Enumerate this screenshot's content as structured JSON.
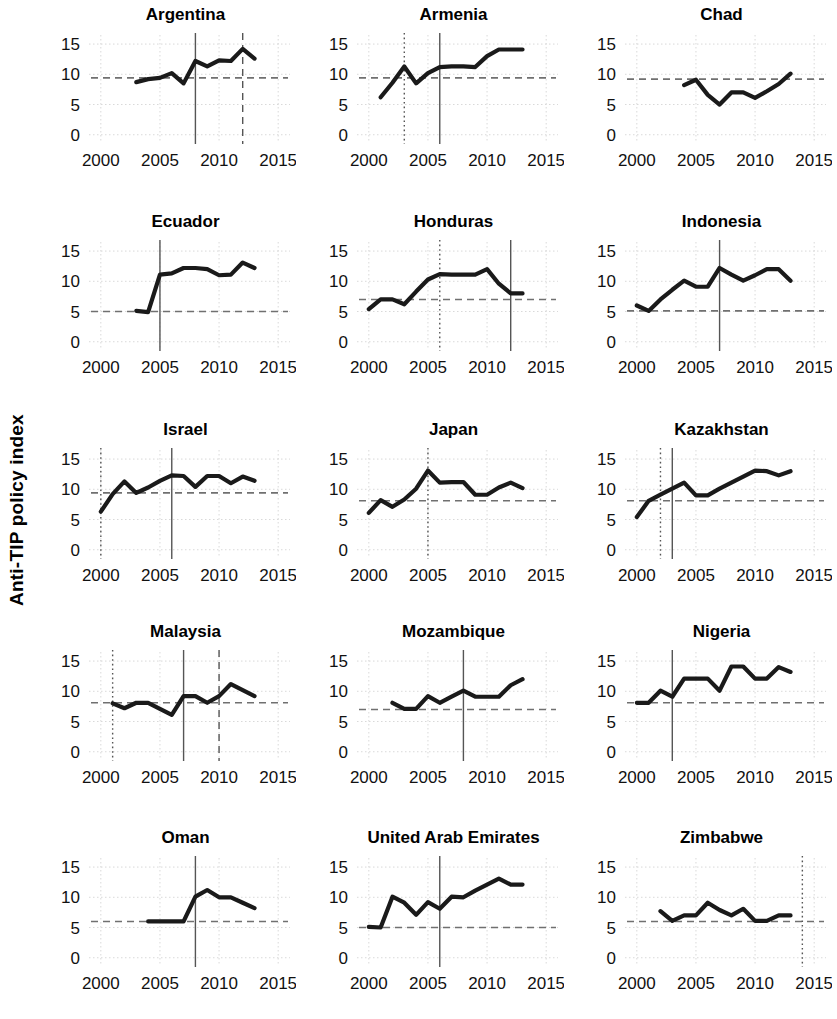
{
  "figure": {
    "ylabel": "Anti-TIP policy index",
    "panel_layout": {
      "rows": 5,
      "cols": 3
    },
    "line_color": "#1a1a1a",
    "grid_color": "#d9d9d9",
    "ref_line_color": "#707070",
    "event_line_color": "#555555"
  },
  "chart_data": {
    "type": "line",
    "title": "",
    "xlabel": "",
    "ylabel": "Anti-TIP policy index",
    "xlim": [
      1999,
      2016
    ],
    "ylim": [
      -1.2,
      16.5
    ],
    "xticks": [
      2000,
      2005,
      2010,
      2015
    ],
    "yticks": [
      0,
      5,
      10,
      15
    ],
    "grid": true,
    "legend": "none",
    "x_tick_labels": [
      "2000",
      "2005",
      "2010",
      "2015"
    ],
    "y_tick_labels": [
      "0",
      "5",
      "10",
      "15"
    ],
    "panels": [
      {
        "name": "Argentina",
        "x": [
          2003,
          2004,
          2005,
          2006,
          2007,
          2008,
          2009,
          2010,
          2011,
          2012,
          2013
        ],
        "values": [
          8.7,
          9.2,
          9.4,
          9.5,
          10.2,
          8.5,
          12.2,
          11.3,
          12.3,
          12.2,
          14.2,
          12.6
        ],
        "series": [
          {
            "name": "Anti-TIP policy index",
            "x": [
              2003,
              2004,
              2005,
              2006,
              2007,
              2008,
              2009,
              2010,
              2011,
              2012,
              2013
            ],
            "y": [
              8.7,
              9.2,
              9.4,
              10.2,
              8.5,
              12.2,
              11.3,
              12.3,
              12.2,
              14.2,
              12.6
            ]
          }
        ],
        "hline": 9.4,
        "vlines": [
          {
            "x": 2008,
            "style": "solid"
          },
          {
            "x": 2012,
            "style": "dashed"
          }
        ]
      },
      {
        "name": "Armenia",
        "series": [
          {
            "name": "Anti-TIP policy index",
            "x": [
              2001,
              2002,
              2003,
              2004,
              2005,
              2006,
              2007,
              2008,
              2009,
              2010,
              2011,
              2012,
              2013
            ],
            "y": [
              6.2,
              8.6,
              11.3,
              8.5,
              10.2,
              11.2,
              11.3,
              11.3,
              11.2,
              13.0,
              14.1,
              14.1,
              14.1
            ]
          }
        ],
        "hline": 9.4,
        "vlines": [
          {
            "x": 2003,
            "style": "dotted"
          },
          {
            "x": 2006,
            "style": "solid"
          }
        ]
      },
      {
        "name": "Chad",
        "series": [
          {
            "name": "Anti-TIP policy index",
            "x": [
              2004,
              2005,
              2006,
              2007,
              2008,
              2009,
              2010,
              2011,
              2012,
              2013
            ],
            "y": [
              8.2,
              9.1,
              6.6,
              5.0,
              7.0,
              7.0,
              6.1,
              7.2,
              8.4,
              10.1
            ]
          }
        ],
        "hline": 9.2,
        "vlines": []
      },
      {
        "name": "Ecuador",
        "series": [
          {
            "name": "Anti-TIP policy index",
            "x": [
              2003,
              2004,
              2005,
              2006,
              2007,
              2008,
              2009,
              2010,
              2011,
              2012,
              2013
            ],
            "y": [
              5.1,
              4.9,
              11.1,
              11.3,
              12.2,
              12.2,
              12.0,
              11.0,
              11.1,
              13.1,
              12.2
            ]
          }
        ],
        "hline": 5.0,
        "vlines": [
          {
            "x": 2005,
            "style": "solid"
          }
        ]
      },
      {
        "name": "Honduras",
        "series": [
          {
            "name": "Anti-TIP policy index",
            "x": [
              2000,
              2001,
              2002,
              2003,
              2004,
              2005,
              2006,
              2007,
              2008,
              2009,
              2010,
              2011,
              2012,
              2013
            ],
            "y": [
              5.4,
              7.0,
              7.0,
              6.2,
              8.3,
              10.3,
              11.2,
              11.1,
              11.1,
              11.1,
              12.0,
              9.6,
              8.0,
              8.0
            ]
          }
        ],
        "hline": 7.0,
        "vlines": [
          {
            "x": 2006,
            "style": "dotted"
          },
          {
            "x": 2012,
            "style": "solid"
          }
        ]
      },
      {
        "name": "Indonesia",
        "series": [
          {
            "name": "Anti-TIP policy index",
            "x": [
              2000,
              2001,
              2002,
              2003,
              2004,
              2005,
              2006,
              2007,
              2008,
              2009,
              2010,
              2011,
              2012,
              2013
            ],
            "y": [
              6.0,
              5.1,
              7.0,
              8.6,
              10.1,
              9.1,
              9.1,
              12.2,
              11.1,
              10.1,
              11.0,
              12.0,
              12.0,
              10.1
            ]
          }
        ],
        "hline": 5.1,
        "vlines": [
          {
            "x": 2007,
            "style": "solid"
          }
        ]
      },
      {
        "name": "Israel",
        "series": [
          {
            "name": "Anti-TIP policy index",
            "x": [
              2000,
              2001,
              2002,
              2003,
              2004,
              2005,
              2006,
              2007,
              2008,
              2009,
              2010,
              2011,
              2012,
              2013
            ],
            "y": [
              6.3,
              9.2,
              11.3,
              9.4,
              10.3,
              11.4,
              12.3,
              12.2,
              10.4,
              12.2,
              12.2,
              11.0,
              12.1,
              11.4
            ]
          }
        ],
        "hline": 9.4,
        "vlines": [
          {
            "x": 2000,
            "style": "dotted"
          },
          {
            "x": 2006,
            "style": "solid"
          }
        ]
      },
      {
        "name": "Japan",
        "series": [
          {
            "name": "Anti-TIP policy index",
            "x": [
              2000,
              2001,
              2002,
              2003,
              2004,
              2005,
              2006,
              2007,
              2008,
              2009,
              2010,
              2011,
              2012,
              2013
            ],
            "y": [
              6.1,
              8.2,
              7.1,
              8.3,
              10.1,
              13.1,
              11.1,
              11.2,
              11.2,
              9.1,
              9.1,
              10.3,
              11.1,
              10.2
            ]
          }
        ],
        "hline": 8.1,
        "vlines": [
          {
            "x": 2005,
            "style": "dotted"
          }
        ]
      },
      {
        "name": "Kazakhstan",
        "series": [
          {
            "name": "Anti-TIP policy index",
            "x": [
              2000,
              2001,
              2002,
              2003,
              2004,
              2005,
              2006,
              2007,
              2008,
              2009,
              2010,
              2011,
              2012,
              2013
            ],
            "y": [
              5.4,
              8.1,
              9.1,
              10.1,
              11.1,
              9.0,
              9.0,
              10.1,
              11.1,
              12.1,
              13.1,
              13.0,
              12.3,
              13.0
            ]
          }
        ],
        "hline": 8.1,
        "vlines": [
          {
            "x": 2002,
            "style": "dotted"
          },
          {
            "x": 2003,
            "style": "solid"
          }
        ]
      },
      {
        "name": "Malaysia",
        "series": [
          {
            "name": "Anti-TIP policy index",
            "x": [
              2001,
              2002,
              2003,
              2004,
              2005,
              2006,
              2007,
              2008,
              2009,
              2010,
              2011,
              2012,
              2013
            ],
            "y": [
              8.0,
              7.2,
              8.1,
              8.1,
              7.1,
              6.1,
              9.2,
              9.2,
              8.1,
              9.2,
              11.2,
              10.2,
              9.2
            ]
          }
        ],
        "hline": 8.1,
        "vlines": [
          {
            "x": 2001,
            "style": "dotted"
          },
          {
            "x": 2007,
            "style": "solid"
          },
          {
            "x": 2010,
            "style": "dashed"
          }
        ]
      },
      {
        "name": "Mozambique",
        "series": [
          {
            "name": "Anti-TIP policy index",
            "x": [
              2002,
              2003,
              2004,
              2005,
              2006,
              2007,
              2008,
              2009,
              2010,
              2011,
              2012,
              2013
            ],
            "y": [
              8.1,
              7.1,
              7.1,
              9.2,
              8.1,
              9.1,
              10.1,
              9.1,
              9.1,
              9.1,
              11.0,
              12.0
            ]
          }
        ],
        "hline": 7.0,
        "vlines": [
          {
            "x": 2008,
            "style": "solid"
          }
        ]
      },
      {
        "name": "Nigeria",
        "series": [
          {
            "name": "Anti-TIP policy index",
            "x": [
              2000,
              2001,
              2002,
              2003,
              2004,
              2005,
              2006,
              2007,
              2008,
              2009,
              2010,
              2011,
              2012,
              2013
            ],
            "y": [
              8.1,
              8.1,
              10.1,
              9.1,
              12.1,
              12.1,
              12.1,
              10.1,
              14.1,
              14.1,
              12.1,
              12.1,
              14.0,
              13.2
            ]
          }
        ],
        "hline": 8.1,
        "vlines": [
          {
            "x": 2003,
            "style": "solid"
          }
        ]
      },
      {
        "name": "Oman",
        "series": [
          {
            "name": "Anti-TIP policy index",
            "x": [
              2004,
              2005,
              2006,
              2007,
              2008,
              2009,
              2010,
              2011,
              2012,
              2013
            ],
            "y": [
              6.0,
              6.0,
              6.0,
              6.0,
              10.1,
              11.2,
              10.0,
              10.0,
              9.1,
              8.2
            ]
          }
        ],
        "hline": 6.0,
        "vlines": [
          {
            "x": 2008,
            "style": "solid"
          }
        ]
      },
      {
        "name": "United Arab Emirates",
        "series": [
          {
            "name": "Anti-TIP policy index",
            "x": [
              2000,
              2001,
              2002,
              2003,
              2004,
              2005,
              2006,
              2007,
              2008,
              2009,
              2010,
              2011,
              2012,
              2013
            ],
            "y": [
              5.1,
              5.0,
              10.1,
              9.1,
              7.1,
              9.2,
              8.1,
              10.1,
              10.0,
              11.1,
              12.1,
              13.1,
              12.1,
              12.1
            ]
          }
        ],
        "hline": 5.0,
        "vlines": [
          {
            "x": 2006,
            "style": "solid"
          }
        ]
      },
      {
        "name": "Zimbabwe",
        "series": [
          {
            "name": "Anti-TIP policy index",
            "x": [
              2002,
              2003,
              2004,
              2005,
              2006,
              2007,
              2008,
              2009,
              2010,
              2011,
              2012,
              2013
            ],
            "y": [
              7.7,
              6.1,
              7.0,
              7.0,
              9.1,
              7.9,
              7.0,
              8.1,
              6.1,
              6.1,
              7.0,
              7.0
            ]
          }
        ],
        "hline": 6.0,
        "vlines": [
          {
            "x": 2014,
            "style": "dotted"
          }
        ]
      }
    ]
  }
}
